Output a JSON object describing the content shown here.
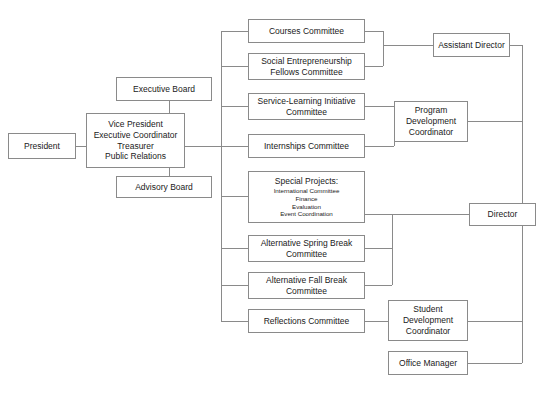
{
  "chart": {
    "type": "org-chart",
    "background_color": "#ffffff",
    "box_border_color": "#8a8a8a",
    "connector_color": "#8a8a8a",
    "text_color": "#1a1a1a"
  },
  "nodes": {
    "president": {
      "label": "President"
    },
    "executive_board": {
      "label": "Executive Board"
    },
    "vice_president_group": {
      "lines": [
        "Vice President",
        "Executive Coordinator",
        "Treasurer",
        "Public Relations"
      ]
    },
    "advisory_board": {
      "label": "Advisory Board"
    },
    "courses_committee": {
      "lines": [
        "Courses Committee"
      ]
    },
    "social_entrepreneurship": {
      "lines": [
        "Social Entrepreneurship",
        "Fellows Committee"
      ]
    },
    "service_learning": {
      "lines": [
        "Service-Learning Initiative",
        "Committee"
      ]
    },
    "internships_committee": {
      "lines": [
        "Internships Committee"
      ]
    },
    "special_projects": {
      "heading": "Special Projects:",
      "items": [
        "International Committee",
        "Finance",
        "Evaluation",
        "Event Coordination"
      ]
    },
    "alternative_spring_break": {
      "lines": [
        "Alternative Spring Break",
        "Committee"
      ]
    },
    "alternative_fall_break": {
      "lines": [
        "Alternative Fall Break",
        "Committee"
      ]
    },
    "reflections_committee": {
      "lines": [
        "Reflections Committee"
      ]
    },
    "assistant_director": {
      "lines": [
        "Assistant Director"
      ]
    },
    "program_development_coordinator": {
      "lines": [
        "Program",
        "Development",
        "Coordinator"
      ]
    },
    "director": {
      "lines": [
        "Director"
      ]
    },
    "student_development_coordinator": {
      "lines": [
        "Student",
        "Development",
        "Coordinator"
      ]
    },
    "office_manager": {
      "lines": [
        "Office Manager"
      ]
    }
  }
}
